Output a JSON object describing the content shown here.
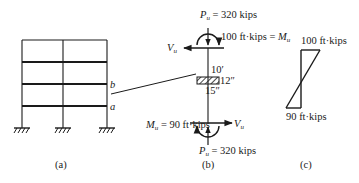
{
  "panel_a": {
    "caption": "(a)",
    "point_b": "b",
    "point_a": "a"
  },
  "panel_b": {
    "caption": "(b)",
    "top_axial": {
      "symbol": "P",
      "sub": "u",
      "text": " = 320 kips"
    },
    "top_moment": {
      "text": "100 ft·kips = ",
      "symbol": "M",
      "sub": "u"
    },
    "top_shear": {
      "symbol": "V",
      "sub": "u"
    },
    "length": "10′",
    "section_depth": "12″",
    "section_width": "15″",
    "bottom_shear": {
      "symbol": "V",
      "sub": "u"
    },
    "bottom_moment": {
      "symbol": "M",
      "sub": "u",
      "text": " = 90 ft·kips"
    },
    "bottom_axial": {
      "symbol": "P",
      "sub": "u",
      "text": " = 320 kips"
    }
  },
  "panel_c": {
    "caption": "(c)",
    "top_value": "100 ft·kips",
    "bottom_value": "90 ft·kips"
  },
  "colors": {
    "ink": "#1a1a1a",
    "background": "#ffffff"
  }
}
